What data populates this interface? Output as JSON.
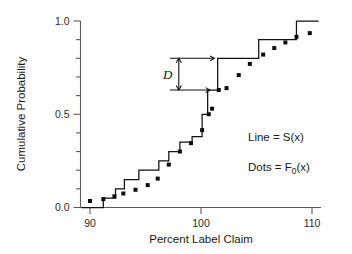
{
  "chart_data": {
    "type": "line",
    "title": "",
    "xlabel": "Percent Label Claim",
    "ylabel": "Cumulative Probability",
    "xlim": [
      89.0,
      111.0
    ],
    "ylim": [
      0.0,
      1.0
    ],
    "xticks": [
      90,
      100,
      110
    ],
    "xtick_labels": [
      "90",
      "100",
      "110"
    ],
    "yticks": [
      0.0,
      0.1,
      0.2,
      0.3,
      0.4,
      0.5,
      0.6,
      0.7,
      0.8,
      0.9,
      1.0
    ],
    "ytick_labels": [
      "0.0",
      "",
      "",
      "",
      "",
      "0.5",
      "",
      "",
      "",
      "",
      "1.0"
    ],
    "grid": false,
    "legend_position": "inside-right",
    "series": [
      {
        "name": "Line = S(x)",
        "type": "step",
        "style": "line",
        "x": [
          89.2,
          90.1,
          91.2,
          92.3,
          93.1,
          94.4,
          95.3,
          96.2,
          97.1,
          98.1,
          99.2,
          100.1,
          100.6,
          101.3,
          101.5,
          102.4,
          103.5,
          104.6,
          105.2,
          107.0,
          108.6,
          110.6
        ],
        "values": [
          0.0,
          0.0,
          0.05,
          0.1,
          0.15,
          0.2,
          0.2,
          0.25,
          0.3,
          0.35,
          0.38,
          0.5,
          0.63,
          0.63,
          0.8,
          0.8,
          0.8,
          0.8,
          0.9,
          0.9,
          1.0,
          1.0
        ]
      },
      {
        "name": "Dots = F0(x)",
        "type": "scatter",
        "style": "square-markers",
        "x": [
          90.0,
          91.2,
          92.2,
          93.0,
          94.1,
          95.2,
          96.1,
          97.1,
          98.1,
          99.1,
          100.1,
          100.7,
          101.0,
          101.6,
          102.3,
          103.4,
          104.4,
          105.6,
          106.6,
          107.6,
          108.6,
          109.8
        ],
        "values": [
          0.035,
          0.045,
          0.06,
          0.075,
          0.095,
          0.12,
          0.155,
          0.23,
          0.3,
          0.345,
          0.415,
          0.5,
          0.53,
          0.63,
          0.64,
          0.71,
          0.77,
          0.82,
          0.855,
          0.885,
          0.915,
          0.935
        ]
      }
    ],
    "annotations": [
      {
        "name": "ks-statistic",
        "label": "D",
        "type": "vertical-double-arrow",
        "x": 98.0,
        "y_top": 0.8,
        "y_bottom": 0.63,
        "ref_line_top": {
          "x_start": 97.2,
          "x_end": 101.2,
          "y": 0.8
        },
        "ref_line_bottom": {
          "x_start": 97.2,
          "x_end": 100.8,
          "y": 0.63
        }
      }
    ],
    "legend_entries": [
      {
        "label_main": "Line = S(x)",
        "prefix": "Line = S",
        "suffix": "(x)"
      },
      {
        "label_main": "Dots = F0(x)",
        "prefix": "Dots = F",
        "subscript": "0",
        "suffix": "(x)"
      }
    ]
  },
  "axes": {
    "x_title": "Percent Label Claim",
    "y_title": "Cumulative Probability",
    "x_tick_labels": [
      "90",
      "100",
      "110"
    ],
    "y_tick_labels": [
      "0.0",
      "0.5",
      "1.0"
    ]
  },
  "annotation": {
    "d_label": "D"
  },
  "legend": {
    "line_prefix": "Line = S",
    "line_suffix": "(x)",
    "dots_prefix": "Dots = F",
    "dots_subscript": "0",
    "dots_suffix": "(x)"
  },
  "colors": {
    "line": "#111111",
    "dot": "#0d0d0d",
    "axis": "#5a5a5a",
    "text": "#1a1a1a",
    "background": "#ffffff"
  }
}
